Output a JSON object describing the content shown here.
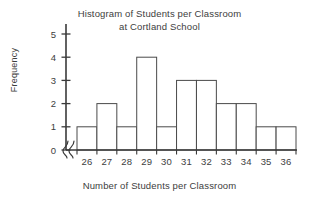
{
  "chart_data": {
    "type": "bar",
    "title": "Histogram of Students per Classroom at Cortland School",
    "title_line1": "Histogram of Students per Classroom",
    "title_line2": "at Cortland School",
    "xlabel": "Number of Students per Classroom",
    "ylabel": "Frequency",
    "categories": [
      "26",
      "27",
      "28",
      "29",
      "30",
      "31",
      "32",
      "33",
      "34",
      "35",
      "36"
    ],
    "values": [
      1,
      2,
      1,
      4,
      1,
      3,
      3,
      2,
      2,
      1,
      1
    ],
    "ylim": [
      0,
      5
    ],
    "yticks": [
      "0",
      "1",
      "2",
      "3",
      "4",
      "5"
    ],
    "grid": false,
    "legend": null,
    "axis_break": true,
    "bar_fill_color": "#ffffff",
    "bar_edge_color": "#4a4a4a",
    "axis_color": "#3a3a3a",
    "background_color": "#ffffff"
  }
}
